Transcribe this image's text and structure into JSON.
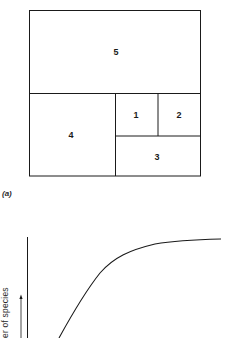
{
  "panel_a": {
    "label": "(a)",
    "regions": [
      {
        "id": "5",
        "label": "5"
      },
      {
        "id": "4",
        "label": "4"
      },
      {
        "id": "1",
        "label": "1"
      },
      {
        "id": "2",
        "label": "2"
      },
      {
        "id": "3",
        "label": "3"
      }
    ]
  },
  "panel_b": {
    "ylabel": "Number of species",
    "ylabel_visible": "er of species",
    "curve_type": "saturating (species-area curve)"
  },
  "colors": {
    "line": "#1a1a1a",
    "background": "#ffffff"
  }
}
